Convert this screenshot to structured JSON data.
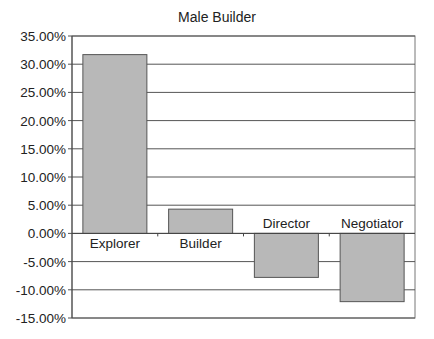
{
  "chart_data": {
    "type": "bar",
    "title": "Male Builder",
    "xlabel": "",
    "ylabel": "",
    "categories": [
      "Explorer",
      "Builder",
      "Director",
      "Negotiator"
    ],
    "values": [
      31.7,
      4.3,
      -7.8,
      -12.1
    ],
    "value_format": "percent",
    "ylim": [
      -15,
      35
    ],
    "yticks": [
      35,
      30,
      25,
      20,
      15,
      10,
      5,
      0,
      -5,
      -10,
      -15
    ],
    "ytick_labels": [
      "35.00%",
      "30.00%",
      "25.00%",
      "20.00%",
      "15.00%",
      "10.00%",
      "5.00%",
      "0.00%",
      "-5.00%",
      "-10.00%",
      "-15.00%"
    ],
    "grid": true,
    "legend": "none",
    "bar_color": "#b8b8b8",
    "category_labels_at_zero_line": true
  }
}
